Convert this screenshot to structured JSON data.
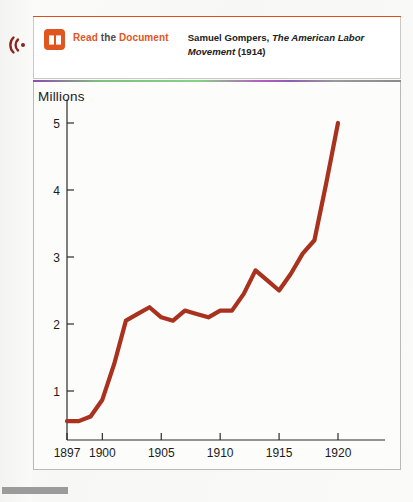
{
  "page": {
    "audio_icon": "audio-waves-icon",
    "accent_orange": "#e1551f",
    "line_color": "#a8321e"
  },
  "doc_callout": {
    "book_icon": "open-book-icon",
    "link_word_1": "Read",
    "link_word_2": "the",
    "link_word_3": "Document",
    "citation_author": "Samuel Gompers,",
    "citation_title": "The American Labor Movement",
    "citation_year": "(1914)"
  },
  "chart_data": {
    "type": "line",
    "title": "",
    "ylabel": "Millions",
    "xlabel": "",
    "xlim": [
      1897,
      1922
    ],
    "ylim": [
      0,
      5.4
    ],
    "grid": false,
    "legend": "none",
    "xticks": [
      "1897",
      "1900",
      "1905",
      "1910",
      "1915",
      "1920"
    ],
    "xtick_values": [
      1897,
      1900,
      1905,
      1910,
      1915,
      1920
    ],
    "yticks": [
      "1",
      "2",
      "3",
      "4",
      "5"
    ],
    "ytick_values": [
      1,
      2,
      3,
      4,
      5
    ],
    "series": [
      {
        "name": "Union membership",
        "x": [
          1897,
          1898,
          1899,
          1900,
          1901,
          1902,
          1903,
          1904,
          1905,
          1906,
          1907,
          1908,
          1909,
          1910,
          1911,
          1912,
          1913,
          1914,
          1915,
          1916,
          1917,
          1918,
          1919,
          1920
        ],
        "values": [
          0.55,
          0.55,
          0.62,
          0.87,
          1.4,
          2.05,
          2.15,
          2.25,
          2.1,
          2.05,
          2.2,
          2.15,
          2.1,
          2.2,
          2.2,
          2.45,
          2.8,
          2.65,
          2.5,
          2.75,
          3.05,
          3.25,
          4.1,
          5.0
        ]
      }
    ]
  }
}
